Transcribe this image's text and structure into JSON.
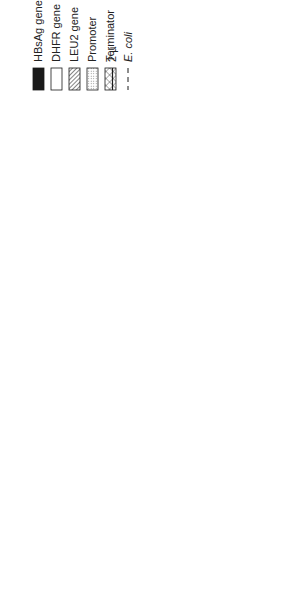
{
  "figure": {
    "number_label": "Figure 1",
    "caption_line1": "General structure of plasmids that direct the expression of HBsAg in recombinant host cells. (A) Yeast",
    "caption_line2": "expression plasmid. (B) Mammalian cell expression plasmid.",
    "orientation": "rotated 90° counter-clockwise (landscape figure on portrait page)"
  },
  "legend": {
    "items": [
      {
        "key": "hbsag",
        "label": "HBsAg gene",
        "pattern": "solid-black"
      },
      {
        "key": "dhfr",
        "label": "DHFR gene",
        "pattern": "white"
      },
      {
        "key": "leu2",
        "label": "LEU2 gene",
        "pattern": "diagonal-hatch"
      },
      {
        "key": "promoter",
        "label": "Promoter",
        "pattern": "stipple"
      },
      {
        "key": "terminator",
        "label": "Terminator",
        "pattern": "crosshatch"
      },
      {
        "key": "two_micron",
        "label": "2 µ",
        "pattern": "solid-line"
      },
      {
        "key": "ecoli",
        "label": "E. coli",
        "pattern": "dashed-line"
      }
    ]
  },
  "panels": {
    "A": {
      "label": "A",
      "title": "Yeast expression plasmid",
      "backbone": [
        "2 µ (solid)",
        "E. coli (dashed, bottom)"
      ],
      "segments": [
        "Terminator",
        "HBsAg gene",
        "Promoter",
        "LEU2 gene"
      ]
    },
    "B": {
      "label": "B",
      "title": "Mammalian cell expression plasmid",
      "backbone": [
        "E. coli (dashed)"
      ],
      "segments": [
        "Terminator",
        "HBsAg gene",
        "Promoter",
        "Promoter",
        "DHFR gene",
        "Terminator"
      ]
    }
  },
  "colors": {
    "ink": "#1a1a1a",
    "paper": "#ffffff"
  }
}
